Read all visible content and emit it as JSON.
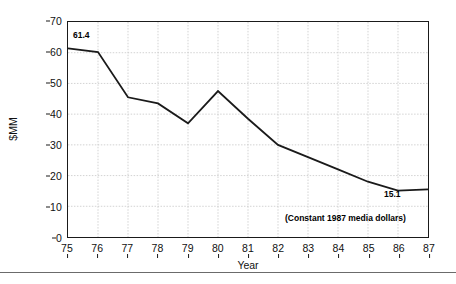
{
  "chart_data": {
    "type": "line",
    "title": "",
    "xlabel": "Year",
    "ylabel": "$MM",
    "categories": [
      "75",
      "76",
      "77",
      "78",
      "79",
      "80",
      "81",
      "82",
      "83",
      "84",
      "85",
      "86",
      "87"
    ],
    "x": [
      75,
      76,
      77,
      78,
      79,
      80,
      81,
      82,
      83,
      84,
      85,
      86,
      87
    ],
    "values": [
      61.4,
      60.2,
      45.5,
      43.5,
      37.0,
      47.5,
      38.5,
      30.0,
      26.0,
      22.0,
      18.0,
      15.1,
      15.5
    ],
    "series": [
      {
        "name": "",
        "values": [
          61.4,
          60.2,
          45.5,
          43.5,
          37.0,
          47.5,
          38.5,
          30.0,
          26.0,
          22.0,
          18.0,
          15.1,
          15.5
        ],
        "color": "#1a1a1a"
      }
    ],
    "ylim": [
      0,
      70
    ],
    "xlim": [
      75,
      87
    ],
    "yticks": [
      0,
      10,
      20,
      30,
      40,
      50,
      60,
      70
    ],
    "ytick_labels": [
      "0",
      "10",
      "20",
      "30",
      "40",
      "50",
      "60",
      "70"
    ],
    "xticks": [
      75,
      76,
      77,
      78,
      79,
      80,
      81,
      82,
      83,
      84,
      85,
      86,
      87
    ],
    "xtick_labels": [
      "75",
      "76",
      "77",
      "78",
      "79",
      "80",
      "81",
      "82",
      "83",
      "84",
      "85",
      "86",
      "87"
    ],
    "grid": true,
    "grid_style": "dotted",
    "grid_color": "#c8c8c8",
    "legend": false,
    "legend_position": "none",
    "line_color": "#1a1a1a",
    "frame_color": "#1a1a1a",
    "background": "#ffffff",
    "annotations": [
      {
        "name": "start-value",
        "text": "61.4",
        "x": 75,
        "y": 61.4
      },
      {
        "name": "end-value",
        "text": "15.1",
        "x": 86,
        "y": 15.1
      },
      {
        "name": "note",
        "text": "(Constant 1987 media dollars)",
        "x": 83,
        "y": 5
      }
    ]
  },
  "annotations": {
    "start_value": "61.4",
    "end_value": "15.1",
    "note": "(Constant 1987 media dollars)"
  }
}
